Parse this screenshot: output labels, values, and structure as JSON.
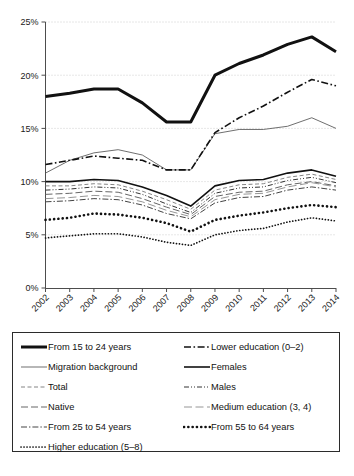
{
  "chart_data": {
    "type": "line",
    "title": "",
    "subtitle": "",
    "xlabel": "",
    "ylabel": "",
    "grid": true,
    "legend_position": "below",
    "x": [
      2002,
      2003,
      2004,
      2005,
      2006,
      2007,
      2008,
      2009,
      2010,
      2011,
      2012,
      2013,
      2014
    ],
    "categories": [
      "2002",
      "2003",
      "2004",
      "2005",
      "2006",
      "2007",
      "2008",
      "2009",
      "2010",
      "2011",
      "2012",
      "2013",
      "2014"
    ],
    "ylim": [
      0,
      25
    ],
    "xlim": [
      2002,
      2014
    ],
    "ytick_labels": [
      "0%",
      "5%",
      "10%",
      "15%",
      "20%",
      "25%"
    ],
    "ytick_values": [
      0,
      5,
      10,
      15,
      20,
      25
    ],
    "series": [
      {
        "name": "From 15 to 24 years",
        "style": "thick-solid",
        "values": [
          18.0,
          18.3,
          18.7,
          18.7,
          17.4,
          15.6,
          15.6,
          20.0,
          21.1,
          21.9,
          22.9,
          23.6,
          22.2
        ]
      },
      {
        "name": "Lower education (0–2)",
        "style": "dash-dot",
        "values": [
          11.6,
          12.0,
          12.4,
          12.2,
          12.0,
          11.1,
          11.1,
          14.6,
          16.0,
          17.1,
          18.4,
          19.6,
          19.0
        ]
      },
      {
        "name": "Migration background",
        "style": "thin-solid",
        "values": [
          10.8,
          12.0,
          12.7,
          13.0,
          12.5,
          11.1,
          11.1,
          14.5,
          14.9,
          14.9,
          15.2,
          16.0,
          15.0
        ]
      },
      {
        "name": "Females",
        "style": "medium-solid",
        "values": [
          10.0,
          10.0,
          10.2,
          10.1,
          9.5,
          8.7,
          7.7,
          9.6,
          10.1,
          10.2,
          10.8,
          11.1,
          10.5
        ]
      },
      {
        "name": "Total",
        "style": "dashed-light",
        "values": [
          9.6,
          9.6,
          9.8,
          9.7,
          9.1,
          8.3,
          7.4,
          9.2,
          9.7,
          9.8,
          10.4,
          10.7,
          10.2
        ]
      },
      {
        "name": "Males",
        "style": "dash-dot-dot",
        "values": [
          9.2,
          9.3,
          9.5,
          9.4,
          8.8,
          7.9,
          7.1,
          8.9,
          9.4,
          9.5,
          10.1,
          10.4,
          9.9
        ]
      },
      {
        "name": "Native",
        "style": "long-dash",
        "values": [
          8.8,
          8.9,
          9.1,
          9.0,
          8.4,
          7.6,
          6.9,
          8.6,
          9.0,
          9.1,
          9.7,
          10.0,
          9.6
        ]
      },
      {
        "name": "Medium education (3, 4)",
        "style": "long-dash-light",
        "values": [
          8.4,
          8.5,
          8.7,
          8.6,
          8.1,
          7.3,
          6.7,
          8.3,
          8.8,
          8.9,
          9.5,
          9.9,
          9.5
        ]
      },
      {
        "name": "From 25 to 54 years",
        "style": "dash-dot-light",
        "values": [
          8.1,
          8.2,
          8.4,
          8.3,
          7.8,
          7.0,
          6.5,
          8.0,
          8.5,
          8.6,
          9.2,
          9.5,
          9.2
        ]
      },
      {
        "name": "From 55 to 64 years",
        "style": "thick-dotted",
        "values": [
          6.4,
          6.6,
          7.0,
          6.9,
          6.6,
          6.1,
          5.3,
          6.4,
          6.8,
          7.1,
          7.5,
          7.8,
          7.6
        ]
      },
      {
        "name": "Higher education (5–8)",
        "style": "fine-dotted",
        "values": [
          4.7,
          4.9,
          5.1,
          5.1,
          4.8,
          4.3,
          4.0,
          5.0,
          5.4,
          5.6,
          6.2,
          6.6,
          6.3
        ]
      }
    ]
  },
  "axis": {
    "y_ticks": [
      "0%",
      "5%",
      "10%",
      "15%",
      "20%",
      "25%"
    ],
    "x_ticks": [
      "2002",
      "2003",
      "2004",
      "2005",
      "2006",
      "2007",
      "2008",
      "2009",
      "2010",
      "2011",
      "2012",
      "2013",
      "2014"
    ]
  },
  "legend": {
    "items": [
      {
        "label": "From 15 to 24 years",
        "style": "thick-solid"
      },
      {
        "label": "Lower education (0–2)",
        "style": "dash-dot"
      },
      {
        "label": "Migration background",
        "style": "thin-solid"
      },
      {
        "label": "Females",
        "style": "medium-solid"
      },
      {
        "label": "Total",
        "style": "dashed-light"
      },
      {
        "label": "Males",
        "style": "dash-dot-dot"
      },
      {
        "label": "Native",
        "style": "long-dash"
      },
      {
        "label": "Medium education (3, 4)",
        "style": "long-dash-light"
      },
      {
        "label": "From 25 to 54 years",
        "style": "dash-dot-light"
      },
      {
        "label": "From 55 to 64 years",
        "style": "thick-dotted"
      },
      {
        "label": "Higher education (5–8)",
        "style": "fine-dotted"
      }
    ]
  },
  "caption": {
    "text": ""
  },
  "colors": {
    "line": "#1a1a1a",
    "grid": "#c9c9c9",
    "axis": "#4d4d4d",
    "light_line": "#8a8a8a",
    "background": "#ffffff"
  }
}
